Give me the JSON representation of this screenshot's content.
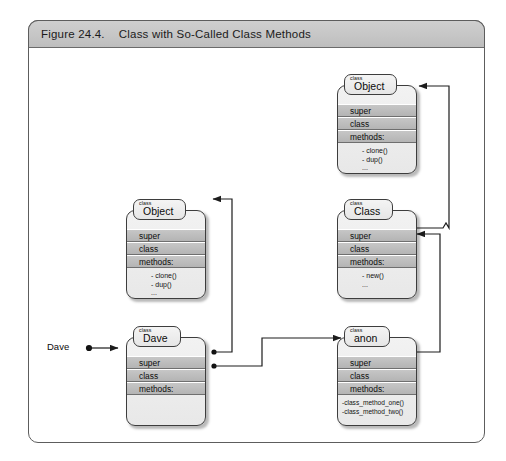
{
  "figure": {
    "number": "Figure 24.4.",
    "caption": "Class with So-Called Class Methods"
  },
  "colors": {
    "frame_border": "#5d5d5d",
    "titlebar_bg": "#c6c6c6",
    "box_border": "#3d3d3d",
    "box_fill": "#ececec",
    "row_fill": "#bdbdbd",
    "connector": "#222222",
    "page_bg": "#ffffff"
  },
  "instance_pointer": {
    "label": "Dave",
    "marker": "filled-dot",
    "arrowhead": "solid-triangle"
  },
  "boxes": [
    {
      "id": "object-top",
      "keyword": "class",
      "name": "Object",
      "rows": [
        "super",
        "class",
        "methods:"
      ],
      "methods": [
        "- clone()",
        "- dup()",
        "..."
      ]
    },
    {
      "id": "class-mid",
      "keyword": "class",
      "name": "Class",
      "rows": [
        "super",
        "class",
        "methods:"
      ],
      "methods": [
        "- new()",
        "..."
      ]
    },
    {
      "id": "object-left",
      "keyword": "class",
      "name": "Object",
      "rows": [
        "super",
        "class",
        "methods:"
      ],
      "methods": [
        "- clone()",
        "- dup()",
        "..."
      ]
    },
    {
      "id": "dave",
      "keyword": "class",
      "name": "Dave",
      "rows": [
        "super",
        "class",
        "methods:"
      ],
      "methods": []
    },
    {
      "id": "anon",
      "keyword": "class",
      "name": "anon",
      "rows": [
        "super",
        "class",
        "methods:"
      ],
      "methods": [
        "-class_method_one()",
        "-class_method_two()"
      ]
    }
  ],
  "connectors": [
    {
      "id": "dave-super-to-object-left",
      "from": "dave.super",
      "to": "object-left.header"
    },
    {
      "id": "dave-class-to-anon",
      "from": "dave.class",
      "to": "anon.header"
    },
    {
      "id": "anon-super-to-object-left",
      "from": "anon.super",
      "to": "object-left.header"
    },
    {
      "id": "anon-class-to-class-mid",
      "from": "anon.class",
      "to": "class-mid.header"
    },
    {
      "id": "class-super-to-object-top",
      "from": "class-mid.super",
      "to": "object-top.header"
    }
  ]
}
